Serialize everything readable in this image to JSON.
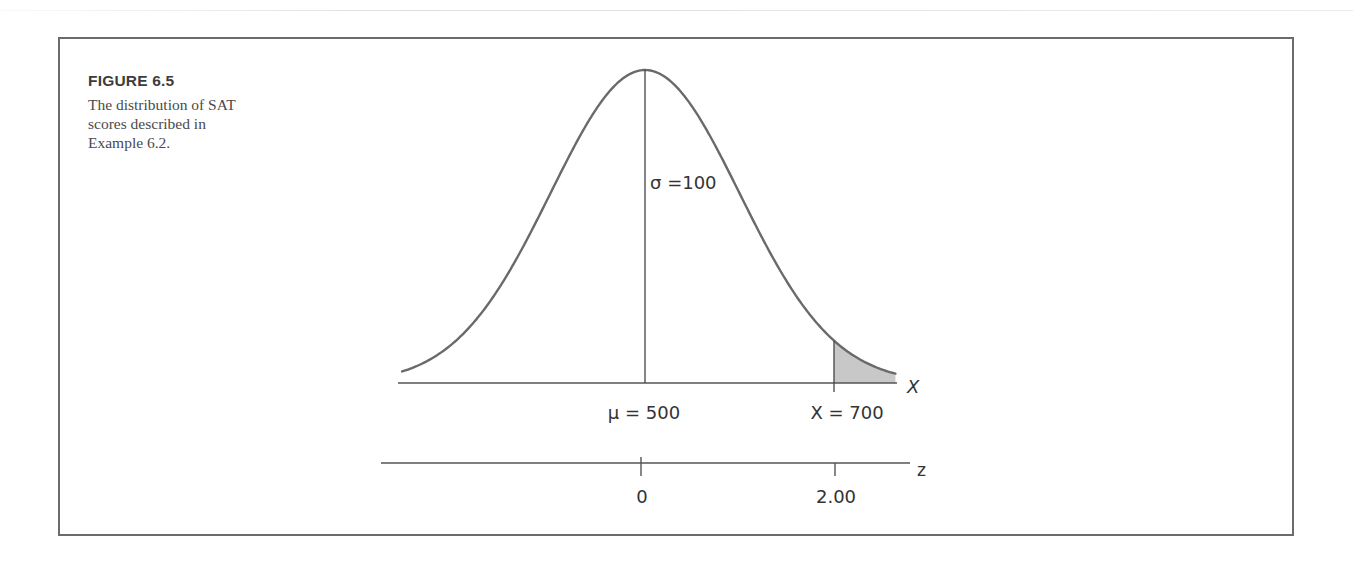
{
  "figure": {
    "label": "FIGURE 6.5",
    "caption": "The distribution of SAT scores described in Example 6.2."
  },
  "colors": {
    "curve": "#6a6a6a",
    "axis": "#555555",
    "shade": "#c8c8c8",
    "border": "#6b6b6b",
    "text": "#333333"
  },
  "chart_data": {
    "type": "area",
    "title": "The distribution of SAT scores described in Example 6.2.",
    "distribution": "normal",
    "mean": 500,
    "sd": 100,
    "x_axis": {
      "label": "X",
      "tick_labels": [
        "μ = 500",
        "X = 700"
      ],
      "tick_values": [
        500,
        700
      ],
      "range": [
        243,
        765
      ]
    },
    "z_axis": {
      "label": "z",
      "tick_labels": [
        "0",
        "2.00"
      ],
      "tick_values": [
        0,
        2.0
      ]
    },
    "annotations": [
      {
        "text": "σ =100",
        "position": "right of mean line"
      },
      {
        "type": "vertical_line",
        "at": 500,
        "description": "mean line from axis to peak"
      },
      {
        "type": "shaded_region",
        "from": 700,
        "to": 765,
        "description": "upper tail beyond X = 700 (z = 2.00)"
      }
    ],
    "grid": false,
    "legend": null
  },
  "labels": {
    "sigma": "σ =100",
    "mu": "μ = 500",
    "x700": "X = 700",
    "x_axis": "X",
    "z_axis": "z",
    "z0": "0",
    "z2": "2.00"
  }
}
